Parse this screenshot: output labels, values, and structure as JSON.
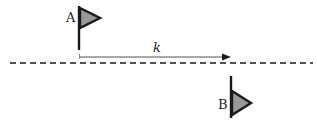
{
  "diagram": {
    "flag_a": {
      "label": "A"
    },
    "flag_b": {
      "label": "B"
    },
    "distance": {
      "label": "k"
    },
    "colors": {
      "flag_fill": "#999999",
      "stroke": "#1a1a1a",
      "arrow": "#555555"
    }
  }
}
